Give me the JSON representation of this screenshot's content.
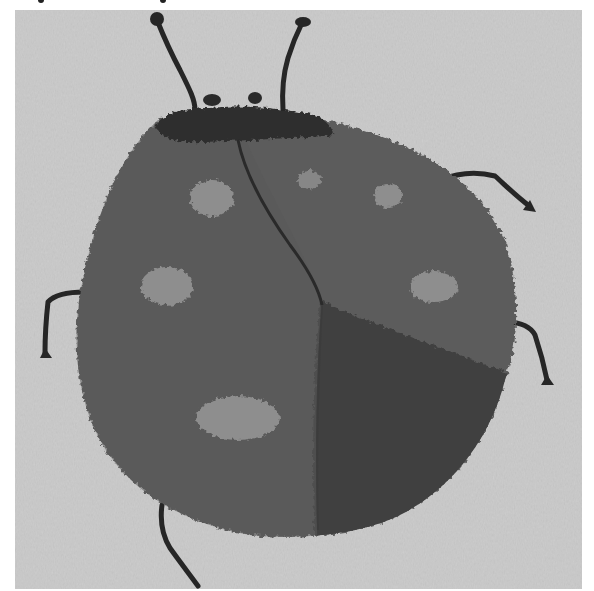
{
  "image": {
    "subject": "Woven tapestry of a ladybug",
    "rendering": "grayscale photograph",
    "colors": {
      "background": "#c9c9c9",
      "body_light": "#5f5f5f",
      "body_dark": "#3f3f3f",
      "head": "#2e2e2e",
      "spots": "#8e8e8e",
      "legs": "#262626"
    },
    "features": {
      "antennae": 2,
      "legs_visible": 5,
      "spots": 7,
      "head_bumps": 2
    }
  }
}
